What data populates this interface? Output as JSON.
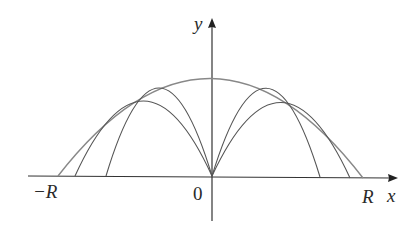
{
  "diagram": {
    "axes": {
      "x_label": "x",
      "y_label": "y",
      "origin_label": "0",
      "neg_R_label": "−R",
      "pos_R_label": "R"
    },
    "colors": {
      "curve": "#555555",
      "envelope": "#888888",
      "axis": "#333333"
    },
    "curves": [
      {
        "name": "envelope",
        "x0": 58,
        "x1": 363,
        "peak_y": 78
      },
      {
        "name": "left-steep",
        "x0": 106,
        "x1": 212,
        "peak_y": 88
      },
      {
        "name": "left-shallow",
        "x0": 75,
        "x1": 212,
        "peak_y": 101
      },
      {
        "name": "right-steep",
        "x0": 212,
        "x1": 320,
        "peak_y": 88
      },
      {
        "name": "right-shallow",
        "x0": 212,
        "x1": 350,
        "peak_y": 102
      }
    ]
  }
}
